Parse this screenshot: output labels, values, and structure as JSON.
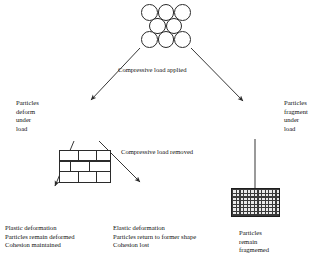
{
  "diagram": {
    "stroke_color": "#2b2b2b",
    "fill_color": "#ffffff",
    "fragment_color": "#3a3a3a",
    "background": "#ffffff"
  },
  "nodes": {
    "intact": {
      "id": "intact-particles",
      "kind": "circle-cluster",
      "rows": [
        3,
        2,
        3
      ],
      "caption": ""
    },
    "deformed_loaded": {
      "id": "deformed-under-load",
      "kind": "brick-wall",
      "rows": 3,
      "caption": "Particles\ndeform\nunder\nload"
    },
    "fragmented_loaded": {
      "id": "fragmented-under-load",
      "kind": "fragment-block",
      "caption": "Particles\nfragment\nunder\nload"
    },
    "plastic": {
      "id": "plastic-deformation",
      "kind": "brick-wall",
      "rows": 3,
      "caption": "Plastic deformation\nParticles remain deformed\nCohesion maintained"
    },
    "elastic": {
      "id": "elastic-deformation",
      "kind": "circle-cluster",
      "rows": [
        3,
        2,
        3
      ],
      "caption": "Elastic deformation\nParticles return to former shape\nCohesion lost"
    },
    "fragmented_final": {
      "id": "fragmented-final",
      "kind": "fragment-block",
      "caption": "Particles\nremain\nfragmemed"
    }
  },
  "edge_labels": {
    "load_applied": "Compressive load applied",
    "load_removed": "Compressive load removed"
  }
}
